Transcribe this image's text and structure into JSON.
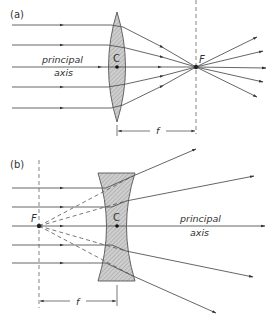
{
  "panel_a": {
    "label": "(a)",
    "lens_type": "converging (convex)",
    "center_label": "C",
    "focal_label": "F",
    "axis_label_line1": "principal",
    "axis_label_line2": "axis",
    "focal_length_label": "f"
  },
  "panel_b": {
    "label": "(b)",
    "lens_type": "diverging (concave)",
    "center_label": "C",
    "focal_label": "F",
    "axis_label_line1": "principal",
    "axis_label_line2": "axis",
    "focal_length_label": "f"
  },
  "colors": {
    "line": "#555555",
    "lens_fill": "#c8c8c8",
    "lens_stroke": "#555555",
    "text": "#333333"
  }
}
